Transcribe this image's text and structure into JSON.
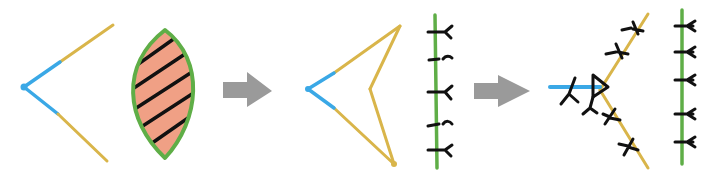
{
  "diagram": {
    "title": "Membrane remodeling sequence (hand-drawn)",
    "colors": {
      "blue": "#3aa8e6",
      "gold": "#d9b54a",
      "green": "#5fae47",
      "salmon": "#f0a085",
      "black": "#111111",
      "arrow_gray": "#9a9a9a",
      "background": "#ffffff"
    },
    "panels": [
      {
        "id": "panel-1",
        "label": "initial state",
        "elements": [
          "open V shape (blue vertex, gold arms)",
          "green-outlined salmon leaf shape with diagonal black hatching"
        ]
      },
      {
        "id": "panel-2",
        "label": "intermediate state",
        "elements": [
          "closed arrowhead shape (blue vertex, gold edges)",
          "vertical green line with 5 black Y-shaped attachments"
        ]
      },
      {
        "id": "panel-3",
        "label": "final state",
        "elements": [
          "blue horizontal line with black triangle at end",
          "diagonal gold lines with black Y-shaped attachments",
          "vertical green line with 5 black Y-shaped attachments"
        ]
      }
    ],
    "arrows": [
      {
        "id": "arrow-1",
        "from": "panel-1",
        "to": "panel-2"
      },
      {
        "id": "arrow-2",
        "from": "panel-2",
        "to": "panel-3"
      }
    ]
  }
}
